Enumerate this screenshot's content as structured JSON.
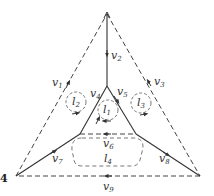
{
  "figure_number": "4",
  "colors": {
    "line": "#333333",
    "dashed": "#444444",
    "loop": "#666666"
  },
  "edges": [
    {
      "id": "v1",
      "label": "v",
      "sub": "1",
      "style": "dashed",
      "from": "bottom-left",
      "to": "top"
    },
    {
      "id": "v2",
      "label": "v",
      "sub": "2",
      "style": "solid",
      "from": "top",
      "to": "center"
    },
    {
      "id": "v3",
      "label": "v",
      "sub": "3",
      "style": "dashed",
      "from": "top",
      "to": "bottom-right"
    },
    {
      "id": "v4",
      "label": "v",
      "sub": "4",
      "style": "solid",
      "from": "inner-left",
      "to": "center"
    },
    {
      "id": "v5",
      "label": "v",
      "sub": "5",
      "style": "solid",
      "from": "center",
      "to": "inner-right"
    },
    {
      "id": "v6",
      "label": "v",
      "sub": "6",
      "style": "dashed",
      "from": "inner-right",
      "to": "inner-left"
    },
    {
      "id": "v7",
      "label": "v",
      "sub": "7",
      "style": "solid",
      "from": "bottom-left",
      "to": "inner-left"
    },
    {
      "id": "v8",
      "label": "v",
      "sub": "8",
      "style": "solid",
      "from": "inner-right",
      "to": "bottom-right"
    },
    {
      "id": "v9",
      "label": "v",
      "sub": "9",
      "style": "dashed",
      "from": "bottom-right",
      "to": "bottom-left"
    }
  ],
  "loops": [
    {
      "id": "l1",
      "label": "l",
      "sub": "1"
    },
    {
      "id": "l2",
      "label": "l",
      "sub": "2"
    },
    {
      "id": "l3",
      "label": "l",
      "sub": "3"
    },
    {
      "id": "l4",
      "label": "l",
      "sub": "4"
    }
  ]
}
